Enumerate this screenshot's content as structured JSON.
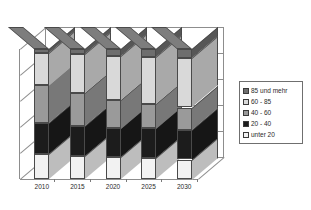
{
  "chart_data": {
    "type": "bar",
    "subtype": "stacked-100-percent-3d",
    "title": "",
    "subtitle": "",
    "xlabel": "",
    "ylabel": "",
    "ylim": [
      0,
      100
    ],
    "grid": true,
    "gridlines": [
      20,
      40,
      60,
      80
    ],
    "legend_position": "right",
    "categories": [
      "2010",
      "2015",
      "2020",
      "2025",
      "2030"
    ],
    "series": [
      {
        "name": "unter 20",
        "color": "#f2f2f2",
        "values": [
          19,
          18,
          17,
          16,
          15
        ]
      },
      {
        "name": "20 - 40",
        "color": "#1c1c1c",
        "values": [
          24,
          23,
          22,
          23,
          23
        ]
      },
      {
        "name": "40 - 60",
        "color": "#9a9a9a",
        "values": [
          29,
          25,
          22,
          19,
          17
        ]
      },
      {
        "name": "60 - 85",
        "color": "#d9d9d9",
        "values": [
          25,
          30,
          34,
          36,
          38
        ]
      },
      {
        "name": "85 und mehr",
        "color": "#6e6e6e",
        "values": [
          3,
          4,
          5,
          6,
          7
        ]
      }
    ]
  },
  "legend": {
    "entries": [
      {
        "label": "85 und mehr",
        "color": "#6e6e6e"
      },
      {
        "label": "60 - 85",
        "color": "#d9d9d9"
      },
      {
        "label": "40 - 60",
        "color": "#9a9a9a"
      },
      {
        "label": "20 - 40",
        "color": "#1c1c1c"
      },
      {
        "label": "unter 20",
        "color": "#f2f2f2"
      }
    ]
  },
  "axis": {
    "x_tick_labels": [
      "2010",
      "2015",
      "2020",
      "2025",
      "2030"
    ]
  }
}
